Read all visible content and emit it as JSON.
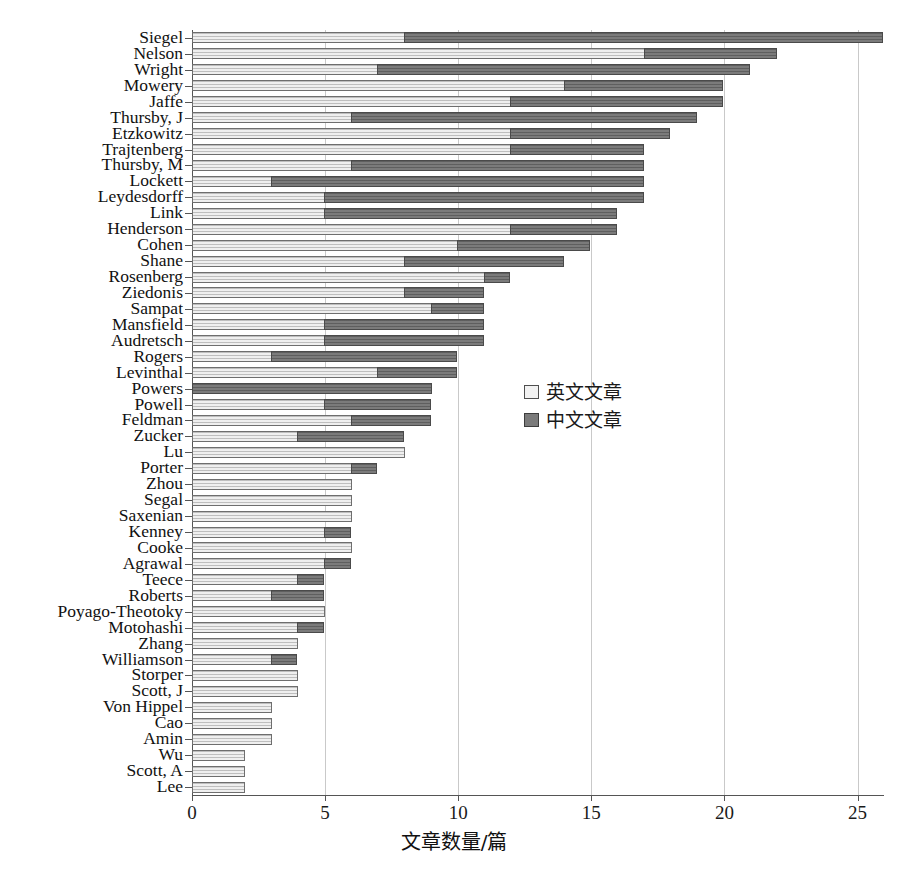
{
  "chart_data": {
    "type": "bar",
    "orientation": "horizontal",
    "stacked": true,
    "title": "",
    "xlabel": "文章数量/篇",
    "ylabel": "",
    "xlim": [
      0,
      26.5
    ],
    "xticks": [
      0,
      5,
      10,
      15,
      20,
      25
    ],
    "grid": "vertical",
    "legend_position": "center-right",
    "series": [
      {
        "name": "英文文章",
        "color": "#efefef",
        "key": "en"
      },
      {
        "name": "中文文章",
        "color": "#7b7b7b",
        "key": "zh"
      }
    ],
    "categories": [
      "Siegel",
      "Nelson",
      "Wright",
      "Mowery",
      "Jaffe",
      "Thursby, J",
      "Etzkowitz",
      "Trajtenberg",
      "Thursby, M",
      "Lockett",
      "Leydesdorff",
      "Link",
      "Henderson",
      "Cohen",
      "Shane",
      "Rosenberg",
      "Ziedonis",
      "Sampat",
      "Mansfield",
      "Audretsch",
      "Rogers",
      "Levinthal",
      "Powers",
      "Powell",
      "Feldman",
      "Zucker",
      "Lu",
      "Porter",
      "Zhou",
      "Segal",
      "Saxenian",
      "Kenney",
      "Cooke",
      "Agrawal",
      "Teece",
      "Roberts",
      "Poyago-Theotoky",
      "Motohashi",
      "Zhang",
      "Williamson",
      "Storper",
      "Scott, J",
      "Von Hippel",
      "Cao",
      "Amin",
      "Wu",
      "Scott, A",
      "Lee"
    ],
    "values_en": [
      8,
      17,
      7,
      14,
      12,
      6,
      12,
      12,
      6,
      3,
      5,
      5,
      12,
      10,
      8,
      11,
      8,
      9,
      5,
      5,
      3,
      7,
      0,
      5,
      6,
      4,
      8,
      6,
      6,
      6,
      6,
      5,
      6,
      5,
      4,
      3,
      5,
      4,
      4,
      3,
      4,
      4,
      3,
      3,
      3,
      2,
      2,
      2
    ],
    "values_zh": [
      18,
      5,
      14,
      6,
      8,
      13,
      6,
      5,
      11,
      14,
      12,
      11,
      4,
      5,
      6,
      1,
      3,
      2,
      6,
      6,
      7,
      3,
      9,
      4,
      3,
      4,
      0,
      1,
      0,
      0,
      0,
      1,
      0,
      1,
      1,
      2,
      0,
      1,
      0,
      1,
      0,
      0,
      0,
      0,
      0,
      0,
      0,
      0
    ],
    "totals": [
      26,
      22,
      21,
      20,
      20,
      19,
      18,
      17,
      17,
      17,
      17,
      16,
      16,
      15,
      14,
      12,
      11,
      11,
      11,
      11,
      10,
      10,
      9,
      9,
      9,
      8,
      8,
      7,
      6,
      6,
      6,
      6,
      6,
      6,
      5,
      5,
      5,
      5,
      4,
      4,
      4,
      4,
      3,
      3,
      3,
      2,
      2,
      2
    ]
  },
  "legend": {
    "items": [
      {
        "label": "英文文章",
        "swatch": "en"
      },
      {
        "label": "中文文章",
        "swatch": "zh"
      }
    ]
  },
  "axis": {
    "x_title": "文章数量/篇",
    "x_tick_labels": [
      "0",
      "5",
      "10",
      "15",
      "20",
      "25"
    ]
  }
}
